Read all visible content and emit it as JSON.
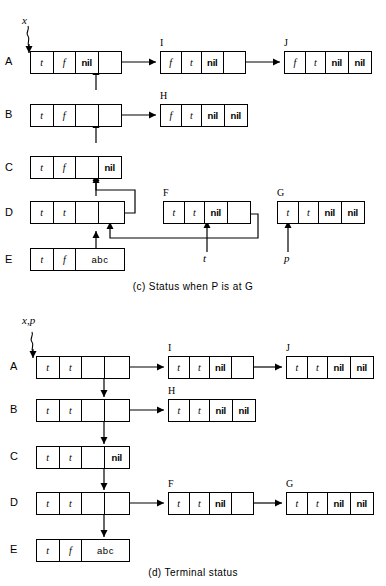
{
  "figure": {
    "stroke_color": "#000000",
    "background_color": "#ffffff"
  },
  "panels": [
    {
      "id": "c",
      "caption": "(c)  Status when P is at G",
      "caption_parts": {
        "tag": "(c)",
        "text": "Status when P is at G"
      },
      "variables": [
        {
          "name": "x",
          "points_to": "A",
          "label": "x"
        }
      ],
      "pointer_labels": [
        {
          "label": "t",
          "target": "F",
          "note": "arrow up into F cell 4"
        },
        {
          "label": "p",
          "target": "G",
          "note": "arrow up into G cell 1"
        }
      ],
      "rows": [
        {
          "row_label": "A",
          "node_label": "",
          "cells": [
            "t",
            "f",
            "nil",
            "ptr"
          ]
        },
        {
          "row_label": "B",
          "node_label": "",
          "cells": [
            "t",
            "f",
            "ptr",
            "ptr"
          ]
        },
        {
          "row_label": "C",
          "node_label": "",
          "cells": [
            "t",
            "f",
            "ptr",
            "nil"
          ]
        },
        {
          "row_label": "D",
          "node_label": "",
          "cells": [
            "t",
            "t",
            "ptr",
            "ptr"
          ]
        },
        {
          "row_label": "E",
          "node_label": "",
          "cells": [
            "t",
            "f",
            "abc"
          ]
        }
      ],
      "side_nodes": [
        {
          "node_label": "I",
          "cells": [
            "f",
            "t",
            "nil",
            "ptr"
          ]
        },
        {
          "node_label": "J",
          "cells": [
            "f",
            "t",
            "nil",
            "nil"
          ]
        },
        {
          "node_label": "H",
          "cells": [
            "f",
            "t",
            "nil",
            "nil"
          ]
        },
        {
          "node_label": "F",
          "cells": [
            "t",
            "t",
            "nil",
            "ptr"
          ]
        },
        {
          "node_label": "G",
          "cells": [
            "t",
            "t",
            "nil",
            "nil"
          ]
        }
      ]
    },
    {
      "id": "d",
      "caption": "(d)  Terminal status",
      "caption_parts": {
        "tag": "(d)",
        "text": "Terminal status"
      },
      "variables": [
        {
          "name": "x,p",
          "points_to": "A",
          "label": "x,p"
        }
      ],
      "pointer_labels": [],
      "rows": [
        {
          "row_label": "A",
          "node_label": "",
          "cells": [
            "t",
            "t",
            "ptr",
            "ptr"
          ]
        },
        {
          "row_label": "B",
          "node_label": "",
          "cells": [
            "t",
            "t",
            "ptr",
            "ptr"
          ]
        },
        {
          "row_label": "C",
          "node_label": "",
          "cells": [
            "t",
            "t",
            "ptr",
            "nil"
          ]
        },
        {
          "row_label": "D",
          "node_label": "",
          "cells": [
            "t",
            "t",
            "ptr",
            "ptr"
          ]
        },
        {
          "row_label": "E",
          "node_label": "",
          "cells": [
            "t",
            "f",
            "abc"
          ]
        }
      ],
      "side_nodes": [
        {
          "node_label": "I",
          "cells": [
            "t",
            "t",
            "nil",
            "ptr"
          ]
        },
        {
          "node_label": "J",
          "cells": [
            "t",
            "t",
            "nil",
            "nil"
          ]
        },
        {
          "node_label": "H",
          "cells": [
            "t",
            "t",
            "nil",
            "nil"
          ]
        },
        {
          "node_label": "F",
          "cells": [
            "t",
            "t",
            "nil",
            "ptr"
          ]
        },
        {
          "node_label": "G",
          "cells": [
            "t",
            "t",
            "nil",
            "nil"
          ]
        }
      ]
    }
  ]
}
